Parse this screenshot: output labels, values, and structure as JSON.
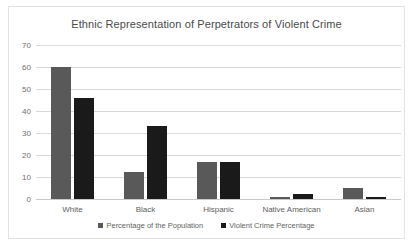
{
  "chart_data": {
    "type": "bar",
    "title": "Ethnic Representation of Perpetrators of Violent Crime",
    "xlabel": "",
    "ylabel": "",
    "ylim": [
      0,
      70
    ],
    "yticks": [
      0,
      10,
      20,
      30,
      40,
      50,
      60,
      70
    ],
    "grid": true,
    "legend_position": "bottom",
    "categories": [
      "White",
      "Black",
      "Hispanic",
      "Native American",
      "Asian"
    ],
    "series": [
      {
        "name": "Percentage of the Population",
        "color": "#595959",
        "values": [
          60,
          12.5,
          17,
          0.8,
          5.2
        ]
      },
      {
        "name": "Violent Crime Percentage",
        "color": "#1a1a1a",
        "values": [
          46,
          33,
          17,
          2.2,
          1.1
        ]
      }
    ]
  }
}
